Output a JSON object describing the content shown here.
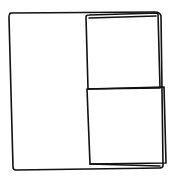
{
  "diagram": {
    "type": "wireframe-sketch",
    "style": "hand-drawn",
    "stroke_color": "#111111",
    "background": "#ffffff",
    "regions": [
      {
        "id": "left-panel",
        "label": ""
      },
      {
        "id": "top-right-panel",
        "label": ""
      },
      {
        "id": "bottom-right-panel",
        "label": ""
      }
    ]
  }
}
